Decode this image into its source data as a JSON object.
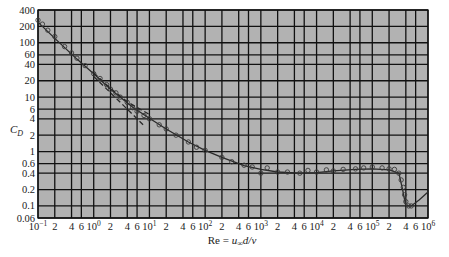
{
  "chart_data": {
    "type": "line",
    "title": "",
    "xlabel": "Re = u∞d/ν",
    "xlabel_parts": {
      "lhs": "Re = ",
      "u": "u",
      "sub": "∞",
      "rest": "d/ν"
    },
    "ylabel": "C_D",
    "ylabel_parts": {
      "main": "C",
      "sub": "D"
    },
    "xscale": "log",
    "yscale": "log",
    "xlim": [
      0.1,
      1000000
    ],
    "ylim": [
      0.06,
      400
    ],
    "grid": true,
    "legend": null,
    "y_ticks": [
      {
        "value": 400,
        "label": "400"
      },
      {
        "value": 200,
        "label": "200"
      },
      {
        "value": 100,
        "label": "100"
      },
      {
        "value": 60,
        "label": "60"
      },
      {
        "value": 40,
        "label": "40"
      },
      {
        "value": 20,
        "label": "20"
      },
      {
        "value": 10,
        "label": "10"
      },
      {
        "value": 6,
        "label": "6"
      },
      {
        "value": 4,
        "label": "4"
      },
      {
        "value": 2,
        "label": "2"
      },
      {
        "value": 1,
        "label": "1"
      },
      {
        "value": 0.6,
        "label": "0.6"
      },
      {
        "value": 0.4,
        "label": "0.4"
      },
      {
        "value": 0.2,
        "label": "0.2"
      },
      {
        "value": 0.1,
        "label": "0.1"
      },
      {
        "value": 0.06,
        "label": "0.06"
      }
    ],
    "x_ticks": [
      {
        "value": 0.1,
        "base": "10",
        "exp": "−1",
        "label": ""
      },
      {
        "value": 0.2,
        "label": "2"
      },
      {
        "value": 0.4,
        "label": "4"
      },
      {
        "value": 0.6,
        "label": "6"
      },
      {
        "value": 1,
        "base": "10",
        "exp": "0",
        "label": ""
      },
      {
        "value": 2,
        "label": "2"
      },
      {
        "value": 4,
        "label": "4"
      },
      {
        "value": 6,
        "label": "6"
      },
      {
        "value": 10,
        "base": "10",
        "exp": "1",
        "label": ""
      },
      {
        "value": 20,
        "label": "2"
      },
      {
        "value": 40,
        "label": "4"
      },
      {
        "value": 60,
        "label": "6"
      },
      {
        "value": 100,
        "base": "10",
        "exp": "2",
        "label": ""
      },
      {
        "value": 200,
        "label": "2"
      },
      {
        "value": 400,
        "label": "4"
      },
      {
        "value": 600,
        "label": "6"
      },
      {
        "value": 1000,
        "base": "10",
        "exp": "3",
        "label": ""
      },
      {
        "value": 2000,
        "label": "2"
      },
      {
        "value": 4000,
        "label": "4"
      },
      {
        "value": 6000,
        "label": "6"
      },
      {
        "value": 10000,
        "base": "10",
        "exp": "4",
        "label": ""
      },
      {
        "value": 20000,
        "label": "2"
      },
      {
        "value": 40000,
        "label": "4"
      },
      {
        "value": 60000,
        "label": "6"
      },
      {
        "value": 100000,
        "base": "10",
        "exp": "5",
        "label": ""
      },
      {
        "value": 200000,
        "label": "2"
      },
      {
        "value": 400000,
        "label": "4"
      },
      {
        "value": 600000,
        "label": "6"
      },
      {
        "value": 1000000,
        "base": "10",
        "exp": "6",
        "label": ""
      }
    ],
    "series": [
      {
        "name": "Experimental curve (sphere)",
        "style": "solid",
        "x": [
          0.1,
          0.2,
          0.5,
          1,
          2,
          5,
          10,
          20,
          50,
          100,
          200,
          500,
          1000,
          2000,
          5000,
          10000,
          20000,
          50000,
          100000,
          200000,
          300000,
          350000,
          400000,
          500000,
          700000,
          1000000
        ],
        "y": [
          240,
          120,
          50,
          27,
          14,
          6.5,
          4.1,
          2.6,
          1.5,
          1.05,
          0.78,
          0.55,
          0.47,
          0.42,
          0.4,
          0.41,
          0.44,
          0.47,
          0.48,
          0.46,
          0.4,
          0.2,
          0.1,
          0.1,
          0.13,
          0.18
        ]
      },
      {
        "name": "Data points",
        "style": "markers",
        "x": [
          0.1,
          0.12,
          0.15,
          0.2,
          0.3,
          0.4,
          0.5,
          0.7,
          1,
          1.3,
          1.7,
          2,
          2.5,
          3,
          4,
          5,
          6,
          8,
          10,
          15,
          20,
          30,
          50,
          70,
          100,
          200,
          300,
          500,
          700,
          1000,
          1300,
          2000,
          3000,
          5000,
          7000,
          10000,
          15000,
          20000,
          30000,
          50000,
          70000,
          100000,
          150000,
          200000,
          250000,
          300000,
          330000,
          360000,
          380000,
          400000,
          450000,
          500000
        ],
        "y": [
          260,
          220,
          170,
          130,
          85,
          65,
          52,
          38,
          27,
          22,
          17,
          14,
          12,
          10,
          8,
          6.4,
          5.5,
          4.6,
          4.0,
          3.1,
          2.6,
          2.0,
          1.5,
          1.2,
          1.05,
          0.78,
          0.65,
          0.56,
          0.52,
          0.4,
          0.5,
          0.42,
          0.42,
          0.4,
          0.45,
          0.42,
          0.46,
          0.44,
          0.47,
          0.48,
          0.5,
          0.52,
          0.5,
          0.48,
          0.47,
          0.4,
          0.3,
          0.22,
          0.16,
          0.12,
          0.1,
          0.1
        ]
      },
      {
        "name": "Stokes theory",
        "style": "dashed",
        "x": [
          1,
          2,
          4,
          8
        ],
        "y": [
          24,
          12,
          6,
          3
        ]
      },
      {
        "name": "Oseen theory",
        "style": "dashed",
        "x": [
          1,
          2,
          4,
          10
        ],
        "y": [
          28,
          14.5,
          8.2,
          4.8
        ]
      }
    ]
  },
  "colors": {
    "plot_bg": "#b2b2b2",
    "grid": "#111111",
    "curve": "#2a2a2a",
    "marker": "#3a3a3a"
  }
}
